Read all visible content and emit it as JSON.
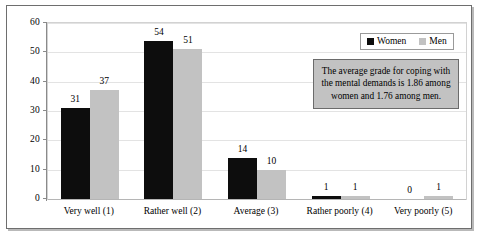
{
  "chart_data": {
    "type": "bar",
    "title": "",
    "subtitle": "",
    "xlabel": "",
    "ylabel": "",
    "ylim": [
      0,
      60
    ],
    "y_ticks": [
      0,
      10,
      20,
      30,
      40,
      50,
      60
    ],
    "grid": true,
    "legend_position": "top-right",
    "categories": [
      "Very well (1)",
      "Rather well (2)",
      "Average (3)",
      "Rather poorly (4)",
      "Very poorly (5)"
    ],
    "series": [
      {
        "name": "Women",
        "color": "#0d0d0d",
        "values": [
          31,
          54,
          14,
          1,
          0
        ]
      },
      {
        "name": "Men",
        "color": "#c2c2c2",
        "values": [
          37,
          51,
          10,
          1,
          1
        ]
      }
    ],
    "annotations": [
      {
        "name": "average-grade-note",
        "text": "The average grade for coping with the mental demands is 1.86 among women and 1.76 among men."
      }
    ]
  },
  "legend": {
    "entries": [
      {
        "label": "Women",
        "swatch": "women-swatch"
      },
      {
        "label": "Men",
        "swatch": "men-swatch"
      }
    ]
  },
  "axes": {
    "y_tick_labels": [
      "60",
      "50",
      "40",
      "30",
      "20",
      "10",
      "0"
    ]
  }
}
